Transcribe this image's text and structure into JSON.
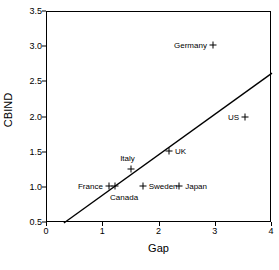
{
  "chart_data": {
    "type": "scatter",
    "title": "",
    "xlabel": "Gap",
    "ylabel": "CBIND",
    "xlim": [
      0,
      4
    ],
    "ylim": [
      0.5,
      3.5
    ],
    "xticks": [
      "0",
      "1",
      "2",
      "3",
      "4"
    ],
    "xtick_values": [
      0,
      1,
      2,
      3,
      4
    ],
    "yticks": [
      "0.5",
      "1.0",
      "1.5",
      "2.0",
      "2.5",
      "3.0",
      "3.5"
    ],
    "ytick_values": [
      0.5,
      1.0,
      1.5,
      2.0,
      2.5,
      3.0,
      3.5
    ],
    "grid": false,
    "legend": "none",
    "marker_symbol": "plus",
    "marker_color": "#000000",
    "points": [
      {
        "label": "Germany",
        "x": 2.95,
        "y": 3.03,
        "label_side": "left"
      },
      {
        "label": "US",
        "x": 3.52,
        "y": 2.01,
        "label_side": "left"
      },
      {
        "label": "UK",
        "x": 2.17,
        "y": 1.52,
        "label_side": "right"
      },
      {
        "label": "Italy",
        "x": 1.49,
        "y": 1.27,
        "label_side": "above-left"
      },
      {
        "label": "France",
        "x": 1.1,
        "y": 1.02,
        "label_side": "left"
      },
      {
        "label": "Canada",
        "x": 1.21,
        "y": 1.02,
        "label_side": "below"
      },
      {
        "label": "Sweden",
        "x": 1.7,
        "y": 1.02,
        "label_side": "right"
      },
      {
        "label": "Japan",
        "x": 2.35,
        "y": 1.02,
        "label_side": "right"
      }
    ],
    "fit_line": {
      "name": "regression-line",
      "x_start": 0.3,
      "y_start": 0.5,
      "x_end": 4.0,
      "y_end": 2.63,
      "color": "#000000"
    }
  }
}
